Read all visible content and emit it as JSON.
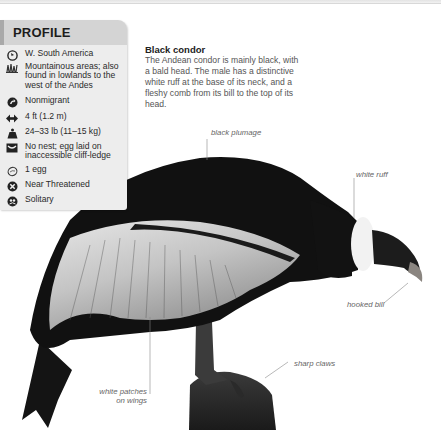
{
  "profile": {
    "title": "PROFILE",
    "items": [
      {
        "icon": "globe-icon",
        "text": "W. South America"
      },
      {
        "icon": "habitat-grass-icon",
        "text": "Mountainous areas; also found in lowlands to the west of the Andes"
      },
      {
        "icon": "migration-arrow-icon",
        "text": "Nonmigrant"
      },
      {
        "icon": "wingspan-arrows-icon",
        "text": "4 ft (1.2 m)"
      },
      {
        "icon": "weight-icon",
        "text": "24–33 lb (11–15 kg)"
      },
      {
        "icon": "nest-icon",
        "text": "No nest; egg laid on inaccessible cliff-ledge"
      },
      {
        "icon": "egg-icon",
        "text": "1 egg"
      },
      {
        "icon": "conservation-status-icon",
        "text": "Near Threatened"
      },
      {
        "icon": "social-icon",
        "text": "Solitary"
      }
    ]
  },
  "caption": {
    "title": "Black condor",
    "body": "The Andean condor is mainly black, with a bald head. The male has a distinctive white ruff at the base of its neck, and a fleshy comb from its bill to the top of its head."
  },
  "labels": {
    "black_plumage": "black plumage",
    "white_ruff": "white ruff",
    "hooked_bill": "hooked bill",
    "sharp_claws": "sharp claws",
    "white_patches_1": "white patches",
    "white_patches_2": "on wings"
  },
  "colors": {
    "profile_bg": "#ededed",
    "profile_header": "#d4d4d4",
    "bird_black": "#111111",
    "wing_grey": "#c9c9c9"
  }
}
